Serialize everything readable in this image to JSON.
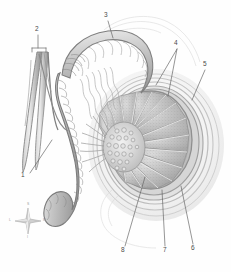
{
  "figure": {
    "style": "grayscale anatomical illustration",
    "background_color": "#fefefe",
    "ink_color": "#4a4a4a",
    "tissue_light": "#e9e9e9",
    "tissue_mid": "#c9c9c9",
    "tissue_dark": "#a6a6a6",
    "tissue_deep": "#8a8a8a"
  },
  "labels": [
    {
      "id": "1",
      "text": "1",
      "x": 24,
      "y": 176,
      "leader": "diagonal-up-right"
    },
    {
      "id": "2",
      "text": "2",
      "x": 36,
      "y": 30,
      "leader": "vertical-down-to-bracket"
    },
    {
      "id": "3",
      "text": "3",
      "x": 106,
      "y": 16,
      "leader": "diagonal-down-right"
    },
    {
      "id": "4",
      "text": "4",
      "x": 176,
      "y": 44,
      "leader": "two-branch-down-left"
    },
    {
      "id": "5",
      "text": "5",
      "x": 205,
      "y": 65,
      "leader": "diagonal-down-left"
    },
    {
      "id": "6",
      "text": "6",
      "x": 193,
      "y": 248,
      "leader": "diagonal-up-left"
    },
    {
      "id": "7",
      "text": "7",
      "x": 165,
      "y": 250,
      "leader": "vertical-up"
    },
    {
      "id": "8",
      "text": "8",
      "x": 123,
      "y": 250,
      "leader": "diagonal-up-right"
    }
  ],
  "orientation_compass": {
    "name": "anatomical-orientation-indicator",
    "center_x": 28,
    "center_y": 221,
    "directions": {
      "top": "S",
      "bottom": "I",
      "left": "L",
      "right": "M"
    }
  },
  "structures": [
    {
      "name": "ductus-deferens",
      "label_ref": "3"
    },
    {
      "name": "testicular-artery-vein",
      "label_ref": "2"
    },
    {
      "name": "spermatic-cord",
      "label_ref": "1"
    },
    {
      "name": "testicular-lobule",
      "label_ref": "4"
    },
    {
      "name": "tunica-vaginalis",
      "label_ref": "5"
    },
    {
      "name": "tunica-albuginea",
      "label_ref": "6"
    },
    {
      "name": "septum",
      "label_ref": "7"
    },
    {
      "name": "seminiferous-tubules",
      "label_ref": "8"
    }
  ]
}
